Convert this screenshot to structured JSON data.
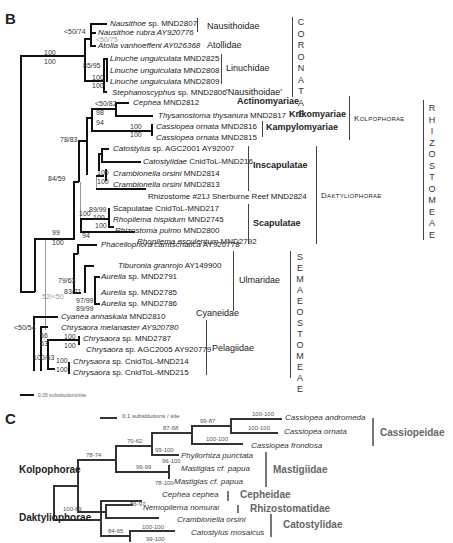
{
  "panel_b": {
    "label": "B",
    "scale_bar": "0.05 substitutions/site",
    "taxa": [
      {
        "genus": "Nausithoe",
        "rest": " sp. MND2807"
      },
      {
        "genus": "Nausithoe rubra",
        "rest": " AY920776"
      },
      {
        "genus": "Atolla vanhoeffeni",
        "rest": " AY026368"
      },
      {
        "genus": "Linuche unguiculata",
        "rest": " MND2825"
      },
      {
        "genus": "Linuche unguiculata",
        "rest": " MND2808"
      },
      {
        "genus": "Linuche unguiculata",
        "rest": " MND2809"
      },
      {
        "genus": "Stephanoscyphus",
        "rest": " sp. MND2806"
      },
      {
        "genus": "Cephea",
        "rest": " MND2812"
      },
      {
        "genus": "Thysanostoma thysanura",
        "rest": " MND2817"
      },
      {
        "genus": "Cassiopea ornata",
        "rest": " MND2816"
      },
      {
        "genus": "Cassiopea ornata",
        "rest": " MND2815"
      },
      {
        "genus": "Catostylus",
        "rest": " sp. AGC2001 AY92007"
      },
      {
        "genus": "Catostylidae",
        "rest": " CnidToL-MND216"
      },
      {
        "genus": "Crambionella orsini",
        "rest": " MND2814"
      },
      {
        "genus": "Crambionella orsini",
        "rest": " MND2813"
      },
      {
        "genus": "",
        "rest": "Rhizostome #21J Sherburne Reef MND2824"
      },
      {
        "genus": "",
        "rest": "Scapulatae CnidToL-MND217"
      },
      {
        "genus": "Rhopilema hispidum",
        "rest": " MND2745"
      },
      {
        "genus": "Rhizostoma pulmo",
        "rest": " MND2800"
      },
      {
        "genus": "Rhopilema esculentum",
        "rest": " MND2792"
      },
      {
        "genus": "Phacellophora camtschatica",
        "rest": " AY920778"
      },
      {
        "genus": "Tiburonia granrojo",
        "rest": " AY149900"
      },
      {
        "genus": "Aurelia",
        "rest": " sp. MND2791"
      },
      {
        "genus": "Aurelia",
        "rest": " sp. MND2785"
      },
      {
        "genus": "Aurelia",
        "rest": " sp. MND2786"
      },
      {
        "genus": "Cyanea annaskala",
        "rest": " MND2810"
      },
      {
        "genus": "Chrysaora melanaster",
        "rest": " AY920780"
      },
      {
        "genus": "Chrysaora",
        "rest": " sp. MND2787"
      },
      {
        "genus": "Chrysaora",
        "rest": " sp. AGC2005 AY920779"
      },
      {
        "genus": "Chrysaora",
        "rest": " sp. CnidToL-MND214"
      },
      {
        "genus": "Chrysaora",
        "rest": " sp. CnidToL-MND215"
      }
    ],
    "support": {
      "root_top": "100",
      "root_bot": "100",
      "naus": "<50/74",
      "naus_grey": "<50/75",
      "linuche": "85/95",
      "lin_top": "100",
      "lin_bot": "100",
      "cephea": "<50/82",
      "kolpo_top": "98",
      "kolpo_bot": "94",
      "cass_top": "100",
      "cass_bot": "100",
      "dakty": "78/83",
      "cramb_top": "100",
      "cramb_bot": "100",
      "rhizo": "84/59",
      "scap": "89/99",
      "rhop_a": "100",
      "rhop_b": "100",
      "scap_c": "100",
      "scap_d": "94",
      "disc_top": "99",
      "disc_bot": "100",
      "ulm": "79/63",
      "ulm2": "83/71",
      "aur1": "97/99",
      "aur2": "89/99",
      "grey_disc": "52/<50",
      "pel_root": "<50/54",
      "pel_top": "56",
      "pel_bot": "63",
      "chry_top": "100",
      "chry_bot": "100",
      "chry2": "100/63",
      "chry3_top": "100",
      "chry3_bot": "100"
    },
    "families": {
      "nausithoidae": "Nausithoidae",
      "atollidae": "Atollidae",
      "linuchidae": "Linuchidae",
      "nausithoidae_q": "'Nausithoidae'",
      "actinomyariae": "Actinomyariae",
      "krikomyariae": "Krikomyariae",
      "kampylomyariae": "Kampylomyariae",
      "inscapulatae": "Inscapulatae",
      "scapulatae": "Scapulatae",
      "kolpophorae": "Kolpophorae",
      "daktyliophorae": "Daktyliophorae",
      "ulmaridae": "Ulmaridae",
      "cyaneidae": "Cyaneidae",
      "pelagiidae": "Pelagiidae"
    },
    "orders": {
      "coronatae": "CORONATAE",
      "rhizostomeae": "RHIZOSTOMEAE",
      "semaeostomeae": "SEMAEOSTOMEAE"
    }
  },
  "panel_c": {
    "label": "C",
    "scale_bar": "0.1 substitutions / site",
    "taxa": [
      "Cassiopea andromeda",
      "Cassiopea ornata",
      "Cassiopea frondosa",
      "Phyllorhiza punctata",
      "Mastigias cf. papua",
      "Mastigias cf. papua",
      "Cephea cephea",
      "Nemopilema nomurai",
      "Crambionella orsini",
      "Catostylus mosaicus"
    ],
    "support": {
      "cass_and": "100-100",
      "cass_orn": "100-100",
      "cass_fr": "100-100",
      "cass_clade": "99-87",
      "cass_mast": "87-68",
      "k1": "70-62",
      "phyl": "99-100",
      "mast": "99-99",
      "mast_a": "96-100",
      "mast_b": "78-100",
      "kolpo": "78-74",
      "ceph": "86-97",
      "dakty": "100-69",
      "cat_clade": "84-65",
      "cramb": "100-100",
      "catos": "99-100"
    },
    "groups": {
      "kolpophorae": "Kolpophorae",
      "daktyliophorae": "Daktyliophorae"
    },
    "families": {
      "cassiopeidae": "Cassiopeidae",
      "mastigiidae": "Mastigiidae",
      "cepheidae": "Cepheidae",
      "rhizostomatidae": "Rhizostomatidae",
      "catostylidae": "Catostylidae"
    }
  }
}
